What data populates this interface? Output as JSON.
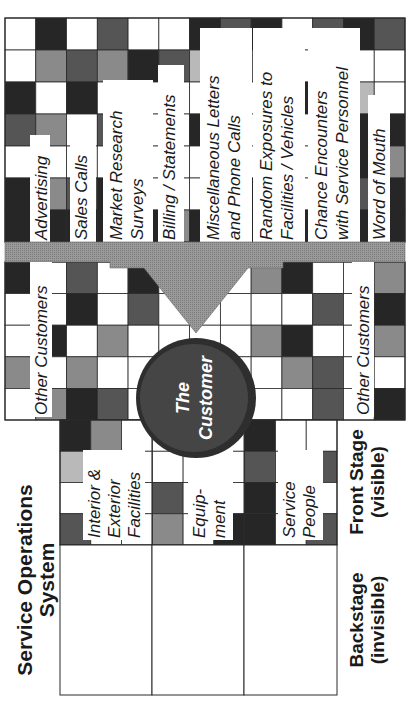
{
  "diagram": {
    "title": "Service Operations System",
    "colors": {
      "white": "#ffffff",
      "light": "#b9b9b9",
      "mid": "#8a8a8a",
      "dark": "#555555",
      "black": "#262626",
      "arrow": "#9a9a9a",
      "circle": "#3a3a3a",
      "line": "#2a2a2a"
    },
    "customer": {
      "line1": "The",
      "line2": "Customer"
    },
    "top_touchpoints": [
      {
        "line1": "Advertising",
        "line2": ""
      },
      {
        "line1": "Sales Calls",
        "line2": ""
      },
      {
        "line1": "Market Research",
        "line2": "Surveys"
      },
      {
        "line1": "Billing / Statements",
        "line2": ""
      },
      {
        "line1": "Miscellaneous Letters",
        "line2": "and Phone Calls"
      },
      {
        "line1": "Random Exposures to",
        "line2": "Facilities / Vehicles"
      },
      {
        "line1": "Chance Encounters",
        "line2": "with Service Personnel"
      },
      {
        "line1": "Word of Mouth",
        "line2": ""
      }
    ],
    "other_customers_left": "Other Customers",
    "other_customers_right": "Other Customers",
    "front_stage_elements": [
      {
        "line1": "Interior &",
        "line2": "Exterior",
        "line3": "Facilities"
      },
      {
        "line1": "Equip-",
        "line2": "ment",
        "line3": ""
      },
      {
        "line1": "Service",
        "line2": "People",
        "line3": ""
      }
    ],
    "side_labels": {
      "front_stage": {
        "line1": "Front Stage",
        "line2": "(visible)"
      },
      "backstage": {
        "line1": "Backstage",
        "line2": "(invisible)"
      }
    },
    "title_lines": {
      "line1": "Service Operations",
      "line2": "System"
    },
    "top_grid": {
      "rows": [
        [
          "white",
          "black",
          "white",
          "dark",
          "white",
          "white",
          "black",
          "dark",
          "black",
          "white",
          "dark",
          "black",
          "dark"
        ],
        [
          "white",
          "mid",
          "dark",
          "mid",
          "black",
          "dark",
          "light",
          "dark",
          "dark",
          "white",
          "black",
          "white",
          "white"
        ],
        [
          "black",
          "white",
          "black",
          "white",
          "white",
          "white",
          "white",
          "black",
          "white",
          "black",
          "mid",
          "light",
          "white"
        ],
        [
          "dark",
          "mid",
          "white",
          "dark",
          "white",
          "white",
          "black",
          "white",
          "white",
          "white",
          "black",
          "black",
          "black"
        ],
        [
          "white",
          "white",
          "white",
          "white",
          "white",
          "white",
          "white",
          "white",
          "white",
          "white",
          "light",
          "black",
          "mid"
        ],
        [
          "black",
          "mid",
          "dark",
          "black",
          "white",
          "white",
          "white",
          "dark",
          "black",
          "white",
          "white",
          "dark",
          "black"
        ],
        [
          "black",
          "black",
          "black",
          "black",
          "black",
          "mid",
          "black",
          "black",
          "black",
          "black",
          "black",
          "black",
          "black"
        ]
      ]
    },
    "mid_grid": {
      "rows": [
        [
          "black",
          "white",
          "dark",
          "white",
          "black",
          "white",
          "white",
          "white",
          "mid",
          "black",
          "white",
          "white",
          "mid"
        ],
        [
          "white",
          "white",
          "black",
          "white",
          "dark",
          "white",
          "white",
          "white",
          "white",
          "white",
          "dark",
          "white",
          "black"
        ],
        [
          "white",
          "black",
          "white",
          "mid",
          "white",
          "white",
          "white",
          "white",
          "mid",
          "black",
          "white",
          "white",
          "mid"
        ],
        [
          "mid",
          "white",
          "mid",
          "white",
          "white",
          "white",
          "white",
          "white",
          "white",
          "mid",
          "dark",
          "white",
          "white"
        ],
        [
          "white",
          "mid",
          "black",
          "dark",
          "white",
          "white",
          "white",
          "white",
          "white",
          "white",
          "dark",
          "white",
          "black"
        ]
      ]
    }
  }
}
